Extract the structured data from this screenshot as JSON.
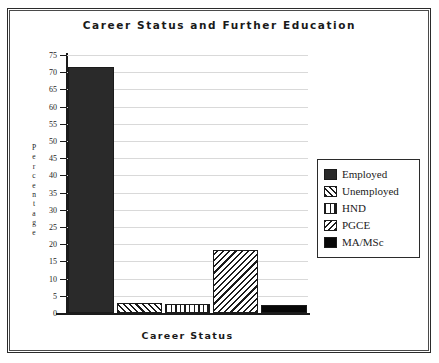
{
  "chart_data": {
    "type": "bar",
    "title": "Career  Status  and  Further  Education",
    "xlabel": "Career   Status",
    "ylabel": "Percentage",
    "categories": [
      "Employed",
      "Unemployed",
      "HND",
      "PGCE",
      "MA/MSc"
    ],
    "values": [
      71.5,
      2.8,
      2.5,
      18.3,
      2.3
    ],
    "ylim": [
      0,
      75
    ],
    "ytick_step": 5,
    "yticks": [
      "75",
      "70",
      "65",
      "60",
      "55",
      "50",
      "45",
      "40",
      "35",
      "30",
      "25",
      "20",
      "15",
      "10",
      "5",
      "0"
    ],
    "grid": true,
    "legend_position": "right",
    "series": [
      {
        "name": "Employed",
        "value": 71.5,
        "pattern": "solid-dark",
        "color": "#2a2a2a"
      },
      {
        "name": "Unemployed",
        "value": 2.8,
        "pattern": "diagonal-up-hatch",
        "color": "#1b1b1b"
      },
      {
        "name": "HND",
        "value": 2.5,
        "pattern": "vertical-lines",
        "color": "#1b1b1b"
      },
      {
        "name": "PGCE",
        "value": 18.3,
        "pattern": "diagonal-down-hatch",
        "color": "#1b1b1b"
      },
      {
        "name": "MA/MSc",
        "value": 2.3,
        "pattern": "solid-black",
        "color": "#070707"
      }
    ]
  },
  "legend": {
    "items": [
      {
        "label": "Employed"
      },
      {
        "label": "Unemployed"
      },
      {
        "label": "HND"
      },
      {
        "label": "PGCE"
      },
      {
        "label": "MA/MSc"
      }
    ]
  },
  "axis": {
    "y_title_letters": [
      "P",
      "e",
      "r",
      "c",
      "e",
      "n",
      "t",
      "a",
      "g",
      "e"
    ]
  },
  "colors": {
    "frame": "#2b2b2b",
    "axis": "#1b1b1b",
    "grid": "#d9d9d9",
    "text": "#1a1a1a",
    "background": "#ffffff"
  }
}
